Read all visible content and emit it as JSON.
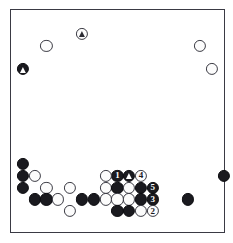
{
  "diagram": {
    "type": "go-board-diagram",
    "board_size": 19,
    "geometry": {
      "origin_x": 11.0,
      "origin_y": 10.2,
      "spacing": 11.82,
      "stone_radius": 6.1
    },
    "colors": {
      "black_stone": "#1a1a1f",
      "white_stone": "#fcfcfc",
      "grid_line": "#6f6f7a",
      "border": "#3a3a44",
      "background": "#ffffff",
      "black_label_text": "#ffffff",
      "white_label_text": "#1a1a1f"
    },
    "star_points": [
      {
        "col": 3,
        "row": 3
      },
      {
        "col": 9,
        "row": 3
      },
      {
        "col": 15,
        "row": 3
      },
      {
        "col": 3,
        "row": 9
      },
      {
        "col": 9,
        "row": 9
      },
      {
        "col": 15,
        "row": 9
      },
      {
        "col": 3,
        "row": 15
      },
      {
        "col": 9,
        "row": 15
      },
      {
        "col": 15,
        "row": 15
      }
    ],
    "stones": [
      {
        "col": 6,
        "row": 2,
        "color": "white",
        "mark": "triangle",
        "name": "white-stone-triangle"
      },
      {
        "col": 3,
        "row": 3,
        "color": "white",
        "mark": "none",
        "name": "white-stone"
      },
      {
        "col": 16,
        "row": 3,
        "color": "white",
        "mark": "none",
        "name": "white-stone"
      },
      {
        "col": 1,
        "row": 5,
        "color": "black",
        "mark": "triangle",
        "name": "black-stone-triangle"
      },
      {
        "col": 17,
        "row": 5,
        "color": "white",
        "mark": "none",
        "name": "white-stone"
      },
      {
        "col": 1,
        "row": 13,
        "color": "black",
        "mark": "none",
        "name": "black-stone"
      },
      {
        "col": 1,
        "row": 14,
        "color": "black",
        "mark": "none",
        "name": "black-stone"
      },
      {
        "col": 2,
        "row": 14,
        "color": "white",
        "mark": "none",
        "name": "white-stone"
      },
      {
        "col": 9,
        "row": 14,
        "color": "black",
        "mark": "number",
        "label": "1",
        "name": "black-stone-move-1"
      },
      {
        "col": 10,
        "row": 14,
        "color": "black",
        "mark": "triangle",
        "name": "black-stone-triangle"
      },
      {
        "col": 11,
        "row": 14,
        "color": "white",
        "mark": "number",
        "label": "4",
        "name": "white-stone-move-4"
      },
      {
        "col": 8,
        "row": 14,
        "color": "white",
        "mark": "none",
        "name": "white-stone"
      },
      {
        "col": 18,
        "row": 14,
        "color": "black",
        "mark": "none",
        "name": "black-stone"
      },
      {
        "col": 1,
        "row": 15,
        "color": "black",
        "mark": "none",
        "name": "black-stone"
      },
      {
        "col": 3,
        "row": 15,
        "color": "white",
        "mark": "none",
        "name": "white-stone"
      },
      {
        "col": 5,
        "row": 15,
        "color": "white",
        "mark": "none",
        "name": "white-stone"
      },
      {
        "col": 8,
        "row": 15,
        "color": "white",
        "mark": "none",
        "name": "white-stone"
      },
      {
        "col": 9,
        "row": 15,
        "color": "black",
        "mark": "none",
        "name": "black-stone"
      },
      {
        "col": 10,
        "row": 15,
        "color": "white",
        "mark": "none",
        "name": "white-stone"
      },
      {
        "col": 11,
        "row": 15,
        "color": "black",
        "mark": "none",
        "name": "black-stone"
      },
      {
        "col": 12,
        "row": 15,
        "color": "black",
        "mark": "number",
        "label": "5",
        "name": "black-stone-move-5"
      },
      {
        "col": 2,
        "row": 16,
        "color": "black",
        "mark": "none",
        "name": "black-stone"
      },
      {
        "col": 3,
        "row": 16,
        "color": "black",
        "mark": "none",
        "name": "black-stone"
      },
      {
        "col": 4,
        "row": 16,
        "color": "white",
        "mark": "none",
        "name": "white-stone"
      },
      {
        "col": 6,
        "row": 16,
        "color": "black",
        "mark": "none",
        "name": "black-stone"
      },
      {
        "col": 7,
        "row": 16,
        "color": "black",
        "mark": "none",
        "name": "black-stone"
      },
      {
        "col": 8,
        "row": 16,
        "color": "white",
        "mark": "none",
        "name": "white-stone"
      },
      {
        "col": 9,
        "row": 16,
        "color": "white",
        "mark": "none",
        "name": "white-stone"
      },
      {
        "col": 10,
        "row": 16,
        "color": "white",
        "mark": "none",
        "name": "white-stone"
      },
      {
        "col": 11,
        "row": 16,
        "color": "black",
        "mark": "none",
        "name": "black-stone"
      },
      {
        "col": 12,
        "row": 16,
        "color": "black",
        "mark": "number",
        "label": "3",
        "name": "black-stone-move-3"
      },
      {
        "col": 15,
        "row": 16,
        "color": "black",
        "mark": "none",
        "name": "black-stone"
      },
      {
        "col": 5,
        "row": 17,
        "color": "white",
        "mark": "none",
        "name": "white-stone"
      },
      {
        "col": 9,
        "row": 17,
        "color": "black",
        "mark": "none",
        "name": "black-stone"
      },
      {
        "col": 10,
        "row": 17,
        "color": "black",
        "mark": "none",
        "name": "black-stone"
      },
      {
        "col": 11,
        "row": 17,
        "color": "white",
        "mark": "none",
        "name": "white-stone"
      },
      {
        "col": 12,
        "row": 17,
        "color": "white",
        "mark": "number",
        "label": "2",
        "name": "white-stone-move-2"
      }
    ],
    "coordinate_labels": [
      {
        "col": 7,
        "row": 14,
        "text": "a",
        "name": "point-label-a"
      },
      {
        "col": 10,
        "row": 13,
        "text": "b",
        "name": "point-label-b"
      }
    ]
  }
}
